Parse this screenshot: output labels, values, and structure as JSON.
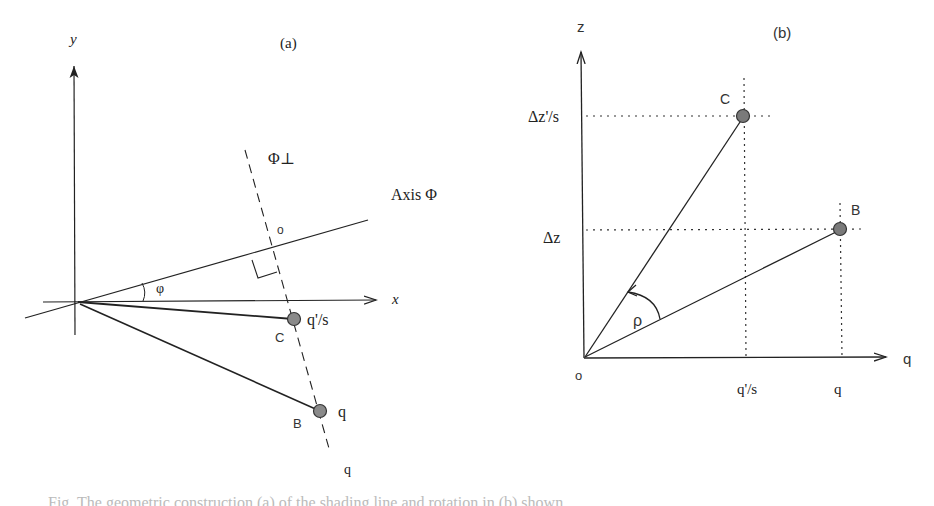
{
  "panel_a": {
    "title": "(a)",
    "y_axis_label": "y",
    "x_axis_label": "x",
    "axis_phi_label": "Axis Φ",
    "phi_perp_label": "Φ⊥",
    "origin_o_label": "o",
    "angle_label": "φ",
    "point_c": {
      "name": "C",
      "value_label": "q'/s"
    },
    "point_b": {
      "name": "B",
      "value_label": "q"
    },
    "dashed_line_end_label": "q"
  },
  "panel_b": {
    "title": "(b)",
    "z_axis_label": "z",
    "q_axis_label": "q",
    "origin_label": "o",
    "angle_label": "ρ",
    "point_c": {
      "name": "C",
      "z_label": "Δz'/s",
      "q_label": "q'/s"
    },
    "point_b": {
      "name": "B",
      "z_label": "Δz",
      "q_label": "q"
    }
  },
  "caption": {
    "text": "Fig. The geometric construction (a) of the shading line and rotation in (b) shown"
  },
  "colors": {
    "line": "#222222",
    "point_fill": "#8a8a8a",
    "point_stroke": "#333333"
  }
}
